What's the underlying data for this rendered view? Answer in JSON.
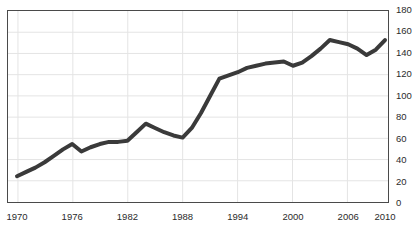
{
  "chart_data": {
    "type": "line",
    "title": "",
    "subtitle": "",
    "xlabel": "",
    "ylabel": "",
    "xlim": [
      1970,
      2010
    ],
    "ylim": [
      0,
      180
    ],
    "grid": true,
    "legend": null,
    "legend_position": "none",
    "y_ticks": [
      0,
      20,
      40,
      60,
      80,
      100,
      120,
      140,
      160,
      180
    ],
    "y_tick_labels": [
      "0",
      "20",
      "40",
      "60",
      "80",
      "100",
      "120",
      "140",
      "160",
      "180"
    ],
    "y_axis_side": "right",
    "x_ticks": [
      1970,
      1976,
      1982,
      1988,
      1994,
      2000,
      2006,
      2010
    ],
    "x_tick_labels": [
      "1970",
      "1976",
      "1982",
      "1988",
      "1994",
      "2000",
      "2006",
      "2010"
    ],
    "x_gridlines": [
      1970,
      1976,
      1982,
      1988,
      1994,
      2000,
      2006
    ],
    "series": [
      {
        "name": "series-1",
        "color": "#3a3a3a",
        "line_width": 4,
        "x": [
          1970,
          1971,
          1972,
          1973,
          1974,
          1975,
          1976,
          1977,
          1978,
          1979,
          1980,
          1981,
          1982,
          1983,
          1984,
          1985,
          1986,
          1987,
          1988,
          1989,
          1990,
          1991,
          1992,
          1993,
          1994,
          1995,
          1996,
          1997,
          1998,
          1999,
          2000,
          2001,
          2002,
          2003,
          2004,
          2005,
          2006,
          2007,
          2008,
          2009,
          2010
        ],
        "y": [
          25,
          29,
          33,
          38,
          44,
          50,
          55,
          48,
          52,
          55,
          57,
          57,
          58,
          66,
          74,
          70,
          66,
          63,
          61,
          70,
          84,
          100,
          116,
          119,
          122,
          126,
          128,
          130,
          131,
          132,
          128,
          131,
          137,
          144,
          152,
          150,
          148,
          144,
          138,
          143,
          152
        ]
      }
    ]
  },
  "colors": {
    "line": "#3a3a3a",
    "grid": "#e4e4e4",
    "axis_border": "#4a4a4a",
    "tick_text": "#2b2b2b",
    "background": "#ffffff"
  }
}
